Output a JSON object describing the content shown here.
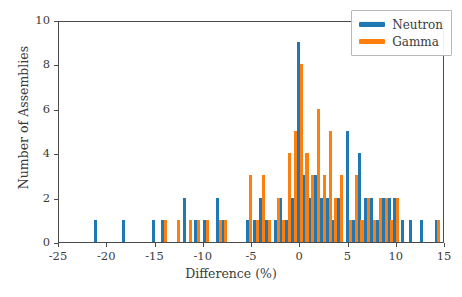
{
  "chart_data": {
    "type": "bar",
    "title": "",
    "xlabel": "Difference (%)",
    "ylabel": "Number of Assemblies",
    "xlim": [
      -25,
      15
    ],
    "ylim": [
      0,
      10
    ],
    "xticks": [
      -25,
      -20,
      -15,
      -10,
      -5,
      0,
      5,
      10,
      15
    ],
    "xticklabels": [
      "-25",
      "-20",
      "-15",
      "-10",
      "-5",
      "0",
      "5",
      "10",
      "15"
    ],
    "yticks": [
      0,
      2,
      4,
      6,
      8,
      10
    ],
    "yticklabels": [
      "0",
      "2",
      "4",
      "6",
      "8",
      "10"
    ],
    "grid": false,
    "legend_position": "upper right",
    "bar_width": 0.32,
    "series": [
      {
        "name": "Neutron",
        "color": "#1f77b4",
        "points": [
          {
            "x": -21.2,
            "y": 1
          },
          {
            "x": -18.3,
            "y": 1
          },
          {
            "x": -15.2,
            "y": 1
          },
          {
            "x": -14.3,
            "y": 1
          },
          {
            "x": -12.0,
            "y": 2
          },
          {
            "x": -10.8,
            "y": 1
          },
          {
            "x": -9.9,
            "y": 1
          },
          {
            "x": -8.6,
            "y": 2
          },
          {
            "x": -8.0,
            "y": 1
          },
          {
            "x": -5.5,
            "y": 1
          },
          {
            "x": -4.7,
            "y": 1
          },
          {
            "x": -4.1,
            "y": 2
          },
          {
            "x": -3.5,
            "y": 1
          },
          {
            "x": -2.6,
            "y": 1
          },
          {
            "x": -2.0,
            "y": 2
          },
          {
            "x": -1.4,
            "y": 1
          },
          {
            "x": -0.8,
            "y": 2
          },
          {
            "x": -0.2,
            "y": 9
          },
          {
            "x": 0.4,
            "y": 3
          },
          {
            "x": 1.0,
            "y": 2
          },
          {
            "x": 1.6,
            "y": 3
          },
          {
            "x": 2.2,
            "y": 2
          },
          {
            "x": 2.8,
            "y": 2
          },
          {
            "x": 3.4,
            "y": 1
          },
          {
            "x": 4.0,
            "y": 2
          },
          {
            "x": 4.9,
            "y": 5
          },
          {
            "x": 5.5,
            "y": 1
          },
          {
            "x": 6.1,
            "y": 4
          },
          {
            "x": 6.8,
            "y": 2
          },
          {
            "x": 7.4,
            "y": 2
          },
          {
            "x": 8.0,
            "y": 1
          },
          {
            "x": 8.6,
            "y": 2
          },
          {
            "x": 9.2,
            "y": 2
          },
          {
            "x": 9.8,
            "y": 2
          },
          {
            "x": 10.6,
            "y": 1
          },
          {
            "x": 11.4,
            "y": 1
          },
          {
            "x": 12.6,
            "y": 1
          },
          {
            "x": 14.1,
            "y": 1
          }
        ]
      },
      {
        "name": "Gamma",
        "color": "#ff7f0e",
        "points": [
          {
            "x": -14.0,
            "y": 1
          },
          {
            "x": -12.6,
            "y": 1
          },
          {
            "x": -11.4,
            "y": 1
          },
          {
            "x": -10.5,
            "y": 1
          },
          {
            "x": -9.6,
            "y": 1
          },
          {
            "x": -8.3,
            "y": 1
          },
          {
            "x": -7.7,
            "y": 1
          },
          {
            "x": -5.2,
            "y": 3
          },
          {
            "x": -4.4,
            "y": 1
          },
          {
            "x": -3.8,
            "y": 3
          },
          {
            "x": -3.2,
            "y": 1
          },
          {
            "x": -2.3,
            "y": 2
          },
          {
            "x": -1.7,
            "y": 1
          },
          {
            "x": -1.1,
            "y": 4
          },
          {
            "x": -0.5,
            "y": 5
          },
          {
            "x": 0.1,
            "y": 8
          },
          {
            "x": 0.7,
            "y": 4
          },
          {
            "x": 1.3,
            "y": 3
          },
          {
            "x": 1.9,
            "y": 6
          },
          {
            "x": 2.5,
            "y": 3
          },
          {
            "x": 3.1,
            "y": 5
          },
          {
            "x": 3.7,
            "y": 2
          },
          {
            "x": 4.3,
            "y": 3
          },
          {
            "x": 5.2,
            "y": 1
          },
          {
            "x": 5.8,
            "y": 3
          },
          {
            "x": 6.4,
            "y": 1
          },
          {
            "x": 7.1,
            "y": 2
          },
          {
            "x": 7.7,
            "y": 1
          },
          {
            "x": 8.3,
            "y": 2
          },
          {
            "x": 8.9,
            "y": 2
          },
          {
            "x": 9.5,
            "y": 1
          },
          {
            "x": 10.1,
            "y": 2
          },
          {
            "x": 14.3,
            "y": 1
          }
        ]
      }
    ]
  },
  "legend": {
    "items": [
      {
        "label": "Neutron",
        "color": "#1f77b4"
      },
      {
        "label": "Gamma",
        "color": "#ff7f0e"
      }
    ]
  }
}
